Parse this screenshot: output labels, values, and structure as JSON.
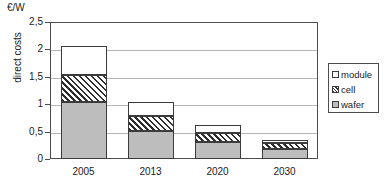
{
  "chart_data": {
    "type": "bar",
    "stacked": true,
    "title": "",
    "subtitle": "",
    "unit_label": "€/W",
    "xlabel": "",
    "ylabel": "direct costs",
    "categories": [
      "2005",
      "2013",
      "2020",
      "2030"
    ],
    "series": [
      {
        "name": "wafer",
        "values": [
          1.04,
          0.52,
          0.31,
          0.19
        ]
      },
      {
        "name": "cell",
        "values": [
          0.49,
          0.26,
          0.16,
          0.11
        ]
      },
      {
        "name": "module",
        "values": [
          0.54,
          0.26,
          0.15,
          0.05
        ]
      }
    ],
    "totals": [
      2.07,
      1.04,
      0.62,
      0.35
    ],
    "ylim": [
      0,
      2.5
    ],
    "ytick_values": [
      0,
      0.5,
      1,
      1.5,
      2,
      2.5
    ],
    "ytick_labels": [
      "0",
      "0,5",
      "1",
      "1,5",
      "2",
      "2,5"
    ],
    "grid": "horizontal",
    "legend_position": "right",
    "legend_entries": [
      "module",
      "cell",
      "wafer"
    ],
    "colors": {
      "wafer": "#bdbdbd",
      "cell": "#ffffff",
      "module": "#ffffff",
      "outline": "#3b3b3b",
      "gridline": "#b4b4b4",
      "axis": "#4d4d4d",
      "text": "#1a1a1a"
    }
  },
  "legend": {
    "items": [
      {
        "label": "module",
        "swatch": "white-square-swatch"
      },
      {
        "label": "cell",
        "swatch": "hatched-square-swatch"
      },
      {
        "label": "wafer",
        "swatch": "gray-square-swatch"
      }
    ]
  }
}
